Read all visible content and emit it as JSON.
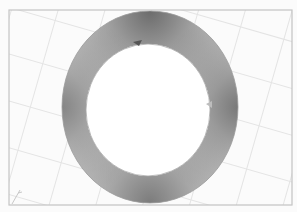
{
  "image": {
    "subject": "shaded ring on tilted grid",
    "colors": {
      "background": "#fbfbfb",
      "frame": "#bdbdbd",
      "grid": "#e6e6e6",
      "ring_light": "#e2e2e2",
      "ring_dark": "#6d6d6d",
      "hole": "#ffffff"
    },
    "frame": {
      "x": 9,
      "y": 10,
      "w": 283,
      "h": 195
    },
    "ring": {
      "outer": {
        "cx": 150,
        "cy": 107,
        "rx": 88,
        "ry": 96
      },
      "inner": {
        "cx": 148,
        "cy": 110,
        "rx": 62,
        "ry": 66
      }
    },
    "axis_indicator": "corner-axis-mark"
  }
}
